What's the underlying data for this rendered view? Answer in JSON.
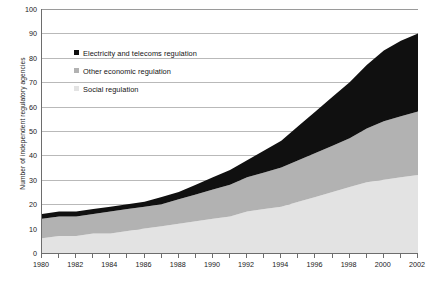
{
  "chart_data": {
    "type": "area",
    "stacked": true,
    "title": "",
    "subtitle": "",
    "xlabel": "",
    "ylabel": "Number of independent regulatory agencies",
    "xlim": [
      1980,
      2002
    ],
    "ylim": [
      0,
      100
    ],
    "ytick_step": 10,
    "xtick_step": 2,
    "grid": true,
    "legend_position": "upper-left-inside",
    "x": [
      1980,
      1981,
      1982,
      1983,
      1984,
      1985,
      1986,
      1987,
      1988,
      1989,
      1990,
      1991,
      1992,
      1993,
      1994,
      1995,
      1996,
      1997,
      1998,
      1999,
      2000,
      2001,
      2002
    ],
    "ytick_labels": [
      "0",
      "10",
      "20",
      "30",
      "40",
      "50",
      "60",
      "70",
      "80",
      "90",
      "100"
    ],
    "xtick_labels": [
      "1980",
      "1982",
      "1984",
      "1986",
      "1988",
      "1990",
      "1992",
      "1994",
      "1996",
      "1998",
      "2000",
      "2002"
    ],
    "series": [
      {
        "name": "Social regulation",
        "color": "#e3e3e3",
        "values": [
          6,
          7,
          7,
          8,
          8,
          9,
          10,
          11,
          12,
          13,
          14,
          15,
          17,
          18,
          19,
          21,
          23,
          25,
          27,
          29,
          30,
          31,
          32
        ]
      },
      {
        "name": "Other economic regulation",
        "color": "#b2b2b2",
        "values": [
          8,
          8,
          8,
          8,
          9,
          9,
          9,
          9,
          10,
          11,
          12,
          13,
          14,
          15,
          16,
          17,
          18,
          19,
          20,
          22,
          24,
          25,
          26
        ]
      },
      {
        "name": "Electricity and telecoms regulation",
        "color": "#101010",
        "values": [
          2,
          2,
          2,
          2,
          2,
          2,
          2,
          3,
          3,
          4,
          5,
          6,
          7,
          9,
          11,
          14,
          17,
          20,
          23,
          26,
          29,
          31,
          32
        ]
      }
    ],
    "totals": [
      16,
      17,
      17,
      18,
      19,
      20,
      21,
      23,
      25,
      28,
      31,
      34,
      38,
      42,
      46,
      52,
      58,
      64,
      70,
      77,
      83,
      87,
      90
    ]
  },
  "legend": {
    "items": [
      {
        "label": "Electricity and telecoms regulation",
        "color": "#101010"
      },
      {
        "label": "Other economic regulation",
        "color": "#b2b2b2"
      },
      {
        "label": "Social regulation",
        "color": "#e3e3e3"
      }
    ]
  },
  "axes": {
    "y_title": "Number of independent regulatory agencies"
  },
  "caption": {
    "text": ""
  }
}
